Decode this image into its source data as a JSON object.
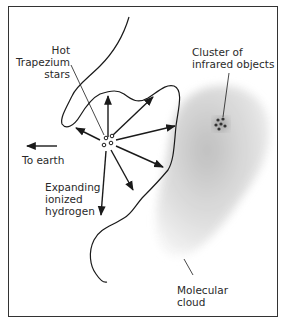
{
  "diagram": {
    "labels": {
      "hot_stars": [
        "Hot",
        "Trapezium",
        "stars"
      ],
      "cluster": [
        "Cluster of",
        "infrared objects"
      ],
      "to_earth": "To earth",
      "ionized_hydrogen": [
        "Expanding",
        "ionized",
        "hydrogen"
      ],
      "molecular_cloud": [
        "Molecular",
        "cloud"
      ]
    },
    "colors": {
      "line": "#1a1a1a",
      "cloud_outer": "#e6e6e6",
      "cloud_inner": "#cfcfcf",
      "cluster_dots": "#333333",
      "frame": "#333333"
    }
  }
}
